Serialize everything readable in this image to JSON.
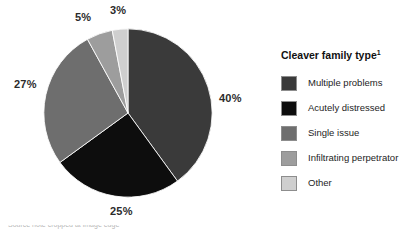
{
  "chart_data": {
    "type": "pie",
    "title": "Cleaver family type",
    "title_superscript": "1",
    "xlabel": "",
    "ylabel": "",
    "legend_position": "right",
    "grid": false,
    "start_angle_deg": 0,
    "direction": "clockwise",
    "categories": [
      "Multiple problems",
      "Acutely distressed",
      "Single issue",
      "Infiltrating perpetrator",
      "Other"
    ],
    "values": [
      40,
      25,
      27,
      5,
      3
    ],
    "value_labels": [
      "40%",
      "25%",
      "27%",
      "5%",
      "3%"
    ],
    "colors": [
      "#3a3a3a",
      "#0d0d0d",
      "#6e6e6e",
      "#9d9d9d",
      "#cfcfcf"
    ]
  },
  "pie": {
    "labels": {
      "multiple_problems": "40%",
      "acutely_distressed": "25%",
      "single_issue": "27%",
      "infiltrating_perpetrator": "5%",
      "other": "3%"
    }
  },
  "legend": {
    "title": "Cleaver family type",
    "title_superscript": "1",
    "items": [
      {
        "label": "Multiple problems",
        "color": "#3a3a3a"
      },
      {
        "label": "Acutely distressed",
        "color": "#0d0d0d"
      },
      {
        "label": "Single issue",
        "color": "#6e6e6e"
      },
      {
        "label": "Infiltrating perpetrator",
        "color": "#9d9d9d"
      },
      {
        "label": "Other",
        "color": "#cfcfcf"
      }
    ]
  },
  "caption": {
    "cropped_text": "Source note cropped at image edge"
  }
}
